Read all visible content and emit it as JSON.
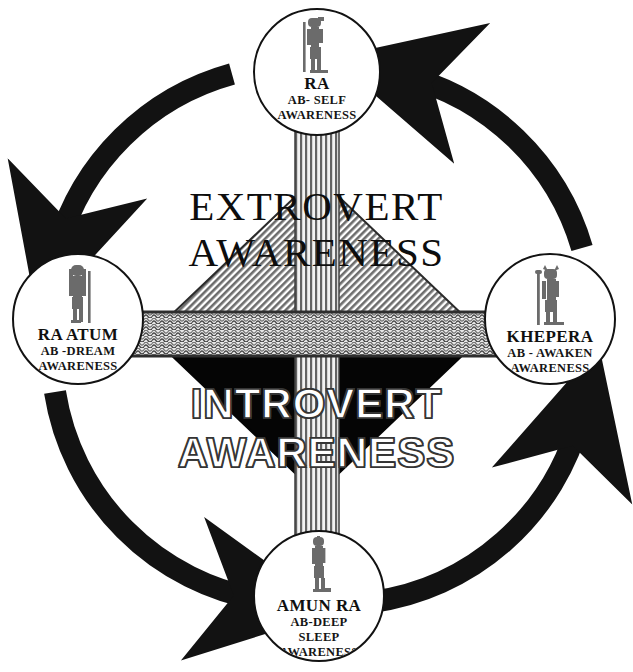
{
  "diagram": {
    "colors": {
      "ring": "#121212",
      "ink": "#101010",
      "background": "#ffffff",
      "triangle_up_fill": "#8f8f8f",
      "triangle_down_fill": "#050505",
      "band_fill": "#b9b9b9",
      "column_fill": "#c9c9c9"
    },
    "center": {
      "upper": {
        "line1": "EXTROVERT",
        "line2": "AWARENESS"
      },
      "lower": {
        "line1": "INTROVERT",
        "line2": "AWARENESS"
      }
    },
    "nodes": [
      {
        "id": "ra",
        "position": "top",
        "icon": "egyptian-deity-figure-ra-icon",
        "title": "RA",
        "sub": [
          "AB- SELF",
          "AWARENESS"
        ]
      },
      {
        "id": "khepera",
        "position": "right",
        "icon": "egyptian-deity-figure-khepera-icon",
        "title": "KHEPERA",
        "sub": [
          "AB - AWAKEN",
          "AWARENESS"
        ]
      },
      {
        "id": "amun-ra",
        "position": "bottom",
        "icon": "egyptian-deity-figure-amun-ra-icon",
        "title": "AMUN RA",
        "sub": [
          "AB-DEEP",
          "SLEEP",
          "AWARENESS"
        ]
      },
      {
        "id": "ra-atum",
        "position": "left",
        "icon": "egyptian-deity-figure-ra-atum-icon",
        "title": "RA ATUM",
        "sub": [
          "AB -DREAM",
          "AWARENESS"
        ]
      }
    ],
    "arrows": [
      {
        "id": "arrow-to-ra",
        "from": "khepera",
        "to": "ra",
        "direction": "counter-clockwise"
      },
      {
        "id": "arrow-to-ra-atum",
        "from": "ra",
        "to": "ra-atum",
        "direction": "counter-clockwise"
      },
      {
        "id": "arrow-to-amun-ra",
        "from": "ra-atum",
        "to": "amun-ra",
        "direction": "counter-clockwise"
      },
      {
        "id": "arrow-to-khepera",
        "from": "amun-ra",
        "to": "khepera",
        "direction": "counter-clockwise"
      }
    ]
  }
}
